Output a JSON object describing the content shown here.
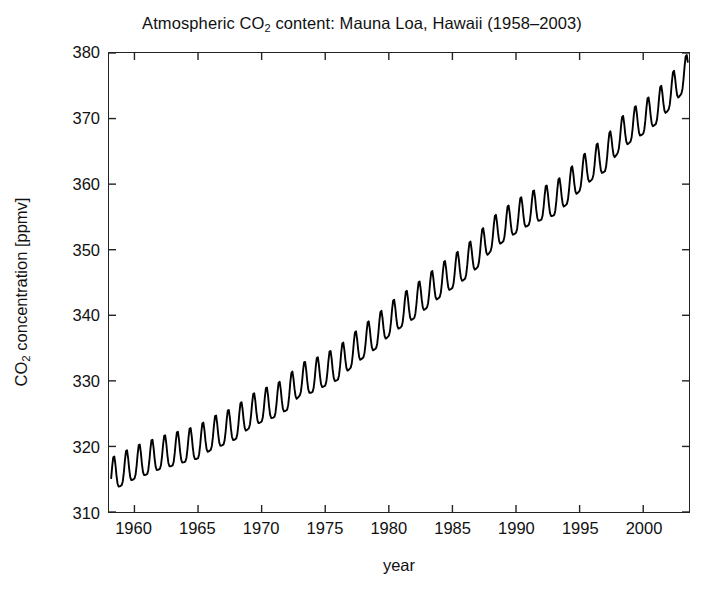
{
  "figure": {
    "background": "#ffffff",
    "frame_color": "#222222",
    "line_color": "#000000",
    "line_width": 1.9
  },
  "chart_data": {
    "type": "line",
    "title_parts": {
      "pre": "Atmospheric CO",
      "sub": "2",
      "post": " content: Mauna Loa, Hawaii (1958–2003)"
    },
    "title": "Atmospheric CO2 content: Mauna Loa, Hawaii (1958–2003)",
    "xlabel": "year",
    "ylabel_parts": {
      "pre": "CO",
      "sub": "2",
      "post": " concentration [ppmv]"
    },
    "ylabel": "CO2 concentration [ppmv]",
    "xlim": [
      1958.0,
      2003.6
    ],
    "ylim": [
      310,
      380
    ],
    "xticks": [
      1960,
      1965,
      1970,
      1975,
      1980,
      1985,
      1990,
      1995,
      2000
    ],
    "yticks": [
      310,
      320,
      330,
      340,
      350,
      360,
      370,
      380
    ],
    "xtick_labels": [
      "1960",
      "1965",
      "1970",
      "1975",
      "1980",
      "1985",
      "1990",
      "1995",
      "2000"
    ],
    "ytick_labels": [
      "310",
      "320",
      "330",
      "340",
      "350",
      "360",
      "370",
      "380"
    ],
    "grid": false,
    "legend": "none",
    "series": [
      {
        "name": "Mauna Loa monthly mean CO2",
        "description": "Keeling curve: rising annual-mean trend with a seasonal sawtooth of about 6 ppmv peak-to-peak; maxima in May, minima in late September.",
        "annual_mean": [
          {
            "year": 1958,
            "value": 315.0
          },
          {
            "year": 1959,
            "value": 315.9
          },
          {
            "year": 1960,
            "value": 316.9
          },
          {
            "year": 1961,
            "value": 317.6
          },
          {
            "year": 1962,
            "value": 318.4
          },
          {
            "year": 1963,
            "value": 318.9
          },
          {
            "year": 1964,
            "value": 319.5
          },
          {
            "year": 1965,
            "value": 320.0
          },
          {
            "year": 1966,
            "value": 321.3
          },
          {
            "year": 1967,
            "value": 322.1
          },
          {
            "year": 1968,
            "value": 323.0
          },
          {
            "year": 1969,
            "value": 324.6
          },
          {
            "year": 1970,
            "value": 325.6
          },
          {
            "year": 1971,
            "value": 326.3
          },
          {
            "year": 1972,
            "value": 327.4
          },
          {
            "year": 1973,
            "value": 329.6
          },
          {
            "year": 1974,
            "value": 330.1
          },
          {
            "year": 1975,
            "value": 331.1
          },
          {
            "year": 1976,
            "value": 332.0
          },
          {
            "year": 1977,
            "value": 333.8
          },
          {
            "year": 1978,
            "value": 335.4
          },
          {
            "year": 1979,
            "value": 336.8
          },
          {
            "year": 1980,
            "value": 338.7
          },
          {
            "year": 1981,
            "value": 340.1
          },
          {
            "year": 1982,
            "value": 341.4
          },
          {
            "year": 1983,
            "value": 343.0
          },
          {
            "year": 1984,
            "value": 344.6
          },
          {
            "year": 1985,
            "value": 346.0
          },
          {
            "year": 1986,
            "value": 347.4
          },
          {
            "year": 1987,
            "value": 349.2
          },
          {
            "year": 1988,
            "value": 351.6
          },
          {
            "year": 1989,
            "value": 353.1
          },
          {
            "year": 1990,
            "value": 354.4
          },
          {
            "year": 1991,
            "value": 355.6
          },
          {
            "year": 1992,
            "value": 356.4
          },
          {
            "year": 1993,
            "value": 357.1
          },
          {
            "year": 1994,
            "value": 358.8
          },
          {
            "year": 1995,
            "value": 360.8
          },
          {
            "year": 1996,
            "value": 362.6
          },
          {
            "year": 1997,
            "value": 363.8
          },
          {
            "year": 1998,
            "value": 366.6
          },
          {
            "year": 1999,
            "value": 368.3
          },
          {
            "year": 2000,
            "value": 369.5
          },
          {
            "year": 2001,
            "value": 371.0
          },
          {
            "year": 2002,
            "value": 373.2
          },
          {
            "year": 2003,
            "value": 375.6
          }
        ],
        "seasonal_amplitude_ppmv": 6.2,
        "seasonal_peak_month": 5,
        "start_value_ppmv": 315.5,
        "end_value_ppmv": 377.0,
        "max_value_ppmv": 378.3,
        "min_value_ppmv": 312.6
      }
    ]
  }
}
